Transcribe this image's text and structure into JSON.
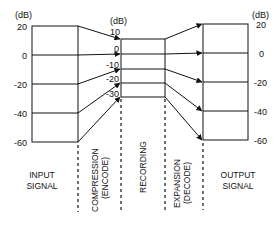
{
  "diagram": {
    "type": "companding-noise-reduction",
    "unit_label": "(dB)",
    "input": {
      "label_line1": "INPUT",
      "label_line2": "SIGNAL",
      "ticks": [
        "20",
        "0",
        "-20",
        "-40",
        "-60"
      ]
    },
    "recording": {
      "ticks": [
        "10",
        "0",
        "-10",
        "-20",
        "-30"
      ]
    },
    "output": {
      "label_line1": "OUTPUT",
      "label_line2": "SIGNAL",
      "ticks": [
        "20",
        "0",
        "-20",
        "-40",
        "-60"
      ]
    },
    "stages": {
      "compression_line1": "COMPRESSION",
      "compression_line2": "(ENCODE)",
      "recording": "RECORDING",
      "expansion_line1": "EXPANSION",
      "expansion_line2": "(DECODE)"
    },
    "line_color": "#111111"
  }
}
